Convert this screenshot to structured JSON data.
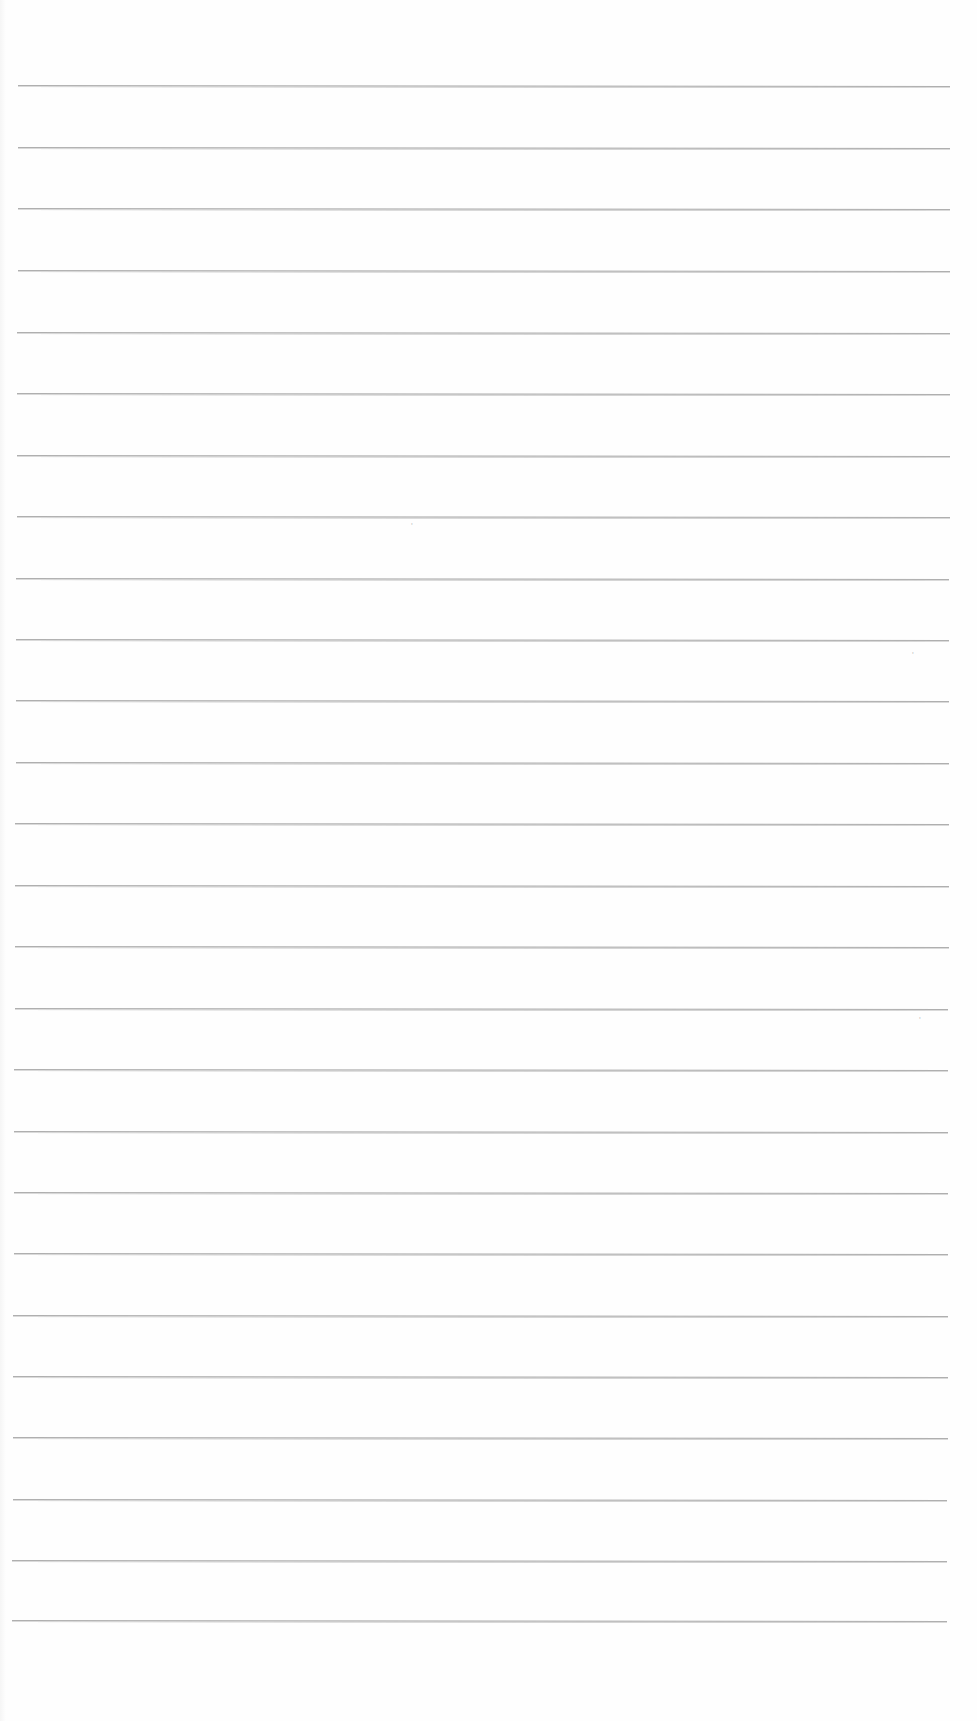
{
  "document": {
    "type": "blank-lined-paper",
    "background_color": "#fefefe",
    "line_color": "#a2a2a2",
    "line_count": 26,
    "lines": [
      {
        "y": 85,
        "x_start": 18,
        "x_end": 950
      },
      {
        "y": 147,
        "x_start": 18,
        "x_end": 950
      },
      {
        "y": 208,
        "x_start": 18,
        "x_end": 950
      },
      {
        "y": 270,
        "x_start": 18,
        "x_end": 950
      },
      {
        "y": 332,
        "x_start": 17,
        "x_end": 950
      },
      {
        "y": 393,
        "x_start": 17,
        "x_end": 950
      },
      {
        "y": 455,
        "x_start": 17,
        "x_end": 950
      },
      {
        "y": 516,
        "x_start": 17,
        "x_end": 950
      },
      {
        "y": 578,
        "x_start": 16,
        "x_end": 949
      },
      {
        "y": 639,
        "x_start": 16,
        "x_end": 949
      },
      {
        "y": 700,
        "x_start": 16,
        "x_end": 949
      },
      {
        "y": 762,
        "x_start": 16,
        "x_end": 949
      },
      {
        "y": 823,
        "x_start": 15,
        "x_end": 949
      },
      {
        "y": 885,
        "x_start": 15,
        "x_end": 949
      },
      {
        "y": 946,
        "x_start": 15,
        "x_end": 949
      },
      {
        "y": 1008,
        "x_start": 15,
        "x_end": 948
      },
      {
        "y": 1069,
        "x_start": 14,
        "x_end": 948
      },
      {
        "y": 1131,
        "x_start": 14,
        "x_end": 948
      },
      {
        "y": 1192,
        "x_start": 14,
        "x_end": 948
      },
      {
        "y": 1253,
        "x_start": 14,
        "x_end": 948
      },
      {
        "y": 1315,
        "x_start": 13,
        "x_end": 948
      },
      {
        "y": 1376,
        "x_start": 13,
        "x_end": 948
      },
      {
        "y": 1437,
        "x_start": 13,
        "x_end": 948
      },
      {
        "y": 1499,
        "x_start": 13,
        "x_end": 947
      },
      {
        "y": 1560,
        "x_start": 12,
        "x_end": 947
      },
      {
        "y": 1620,
        "x_start": 12,
        "x_end": 947
      }
    ]
  }
}
